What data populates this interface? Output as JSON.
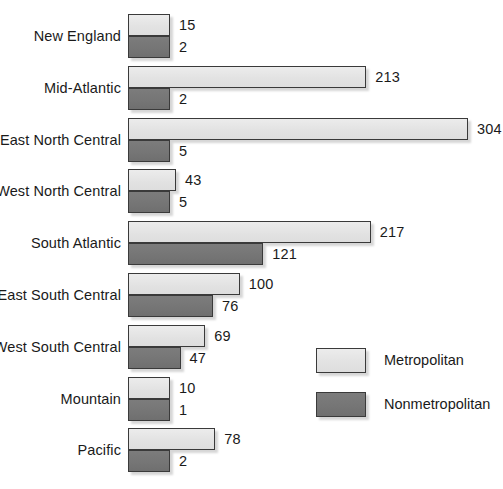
{
  "chart_data": {
    "type": "bar",
    "orientation": "horizontal",
    "title": "",
    "subtitle": "",
    "xlabel": "",
    "ylabel": "",
    "grid": false,
    "legend_position": "inside-right-lower",
    "xlim": [
      0,
      304
    ],
    "categories": [
      "New England",
      "Mid-Atlantic",
      "East North Central",
      "West North Central",
      "South Atlantic",
      "East South Central",
      "West South Central",
      "Mountain",
      "Pacific"
    ],
    "series": [
      {
        "name": "Metropolitan",
        "color": "#e2e2e2",
        "values": [
          15,
          213,
          304,
          43,
          217,
          100,
          69,
          10,
          78
        ]
      },
      {
        "name": "Nonmetropolitan",
        "color": "#757575",
        "values": [
          2,
          2,
          5,
          5,
          121,
          76,
          47,
          1,
          2
        ]
      }
    ],
    "value_labels": {
      "Metropolitan": [
        "15",
        "213",
        "304",
        "43",
        "217",
        "100",
        "69",
        "10",
        "78"
      ],
      "Nonmetropolitan": [
        "2",
        "2",
        "5",
        "5",
        "121",
        "76",
        "47",
        "1",
        "2"
      ]
    }
  },
  "legend": {
    "items": [
      {
        "label": "Metropolitan",
        "swatch": "metro"
      },
      {
        "label": "Nonmetropolitan",
        "swatch": "nonmetro"
      }
    ]
  }
}
